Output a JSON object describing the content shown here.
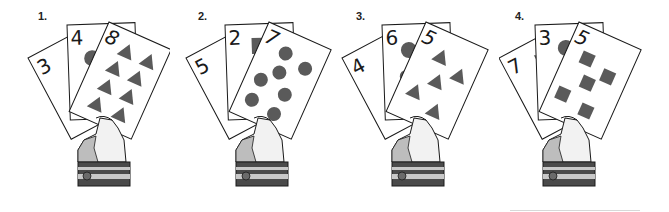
{
  "colors": {
    "shape_fill": "#5a5a5a",
    "outline": "#1a1a1a",
    "card_bg": "#ffffff",
    "hand_shade": "#bdbdbd",
    "hand_light": "#f2f2f2",
    "cuff_dark": "#4a4a4a",
    "cuff_light": "#c8c8c8"
  },
  "hands": [
    {
      "label": "1.",
      "cards": [
        {
          "position": "back-left",
          "number": "3",
          "shape": "square",
          "count": 3
        },
        {
          "position": "back-middle",
          "number": "4",
          "shape": "circle",
          "count": 4
        },
        {
          "position": "front",
          "number": "8",
          "shape": "triangle",
          "count": 8
        }
      ]
    },
    {
      "label": "2.",
      "cards": [
        {
          "position": "back-left",
          "number": "5",
          "shape": "circle",
          "count": 5
        },
        {
          "position": "back-middle",
          "number": "2",
          "shape": "square",
          "count": 2
        },
        {
          "position": "front",
          "number": "7",
          "shape": "circle",
          "count": 7
        }
      ]
    },
    {
      "label": "3.",
      "cards": [
        {
          "position": "back-left",
          "number": "4",
          "shape": "square",
          "count": 4
        },
        {
          "position": "back-middle",
          "number": "6",
          "shape": "circle",
          "count": 6
        },
        {
          "position": "front",
          "number": "5",
          "shape": "triangle",
          "count": 5
        }
      ]
    },
    {
      "label": "4.",
      "cards": [
        {
          "position": "back-left",
          "number": "7",
          "shape": "triangle",
          "count": 7
        },
        {
          "position": "back-middle",
          "number": "3",
          "shape": "circle",
          "count": 3
        },
        {
          "position": "front",
          "number": "5",
          "shape": "square",
          "count": 5
        }
      ]
    }
  ]
}
